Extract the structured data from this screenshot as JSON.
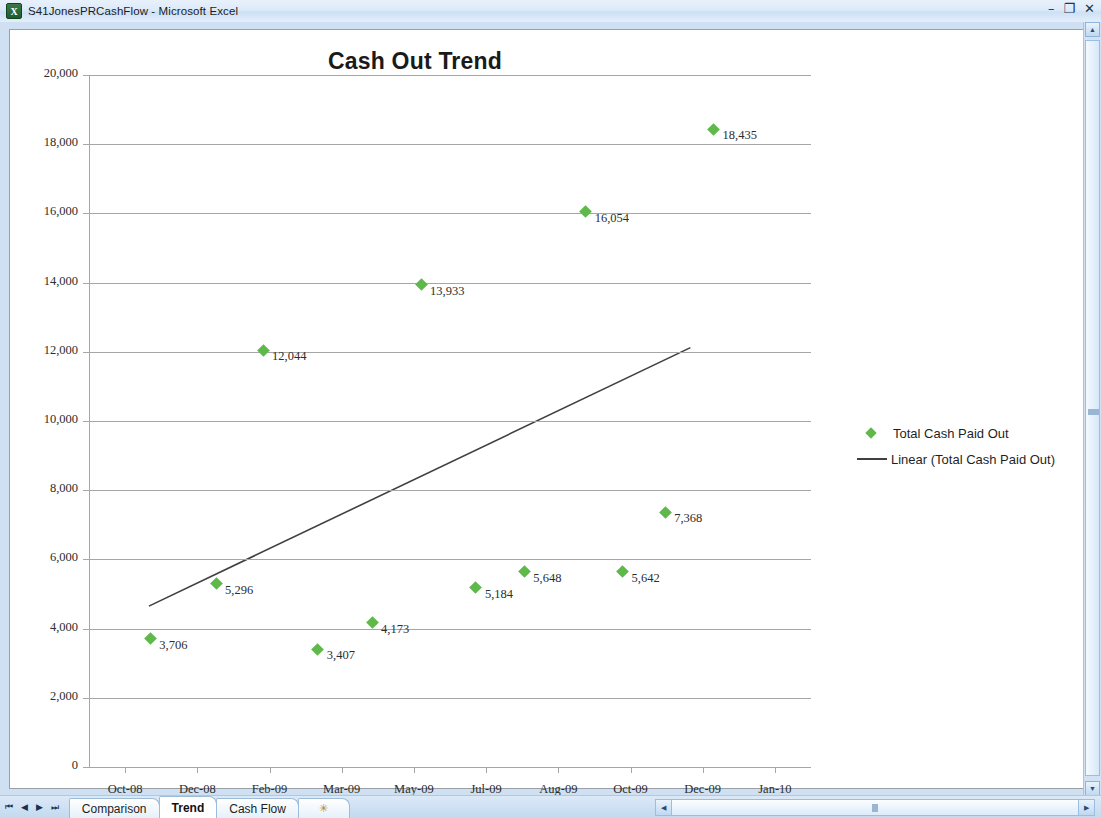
{
  "window": {
    "title": "S41JonesPRCashFlow - Microsoft Excel",
    "app_icon": "excel-icon",
    "controls": {
      "minimize": "–",
      "restore": "❐",
      "close": "✕"
    }
  },
  "sheet_tabs": {
    "nav": {
      "first": "⏮",
      "prev": "◀",
      "next": "▶",
      "last": "⏭"
    },
    "items": [
      {
        "label": "Comparison",
        "active": false
      },
      {
        "label": "Trend",
        "active": true
      },
      {
        "label": "Cash Flow",
        "active": false
      }
    ],
    "insert_tab": "✳"
  },
  "chart_data": {
    "type": "scatter",
    "title": "Cash Out Trend",
    "xlabel": "",
    "ylabel": "",
    "ylim": [
      0,
      20000
    ],
    "grid": true,
    "legend_position": "right",
    "y_ticks": [
      "0",
      "2,000",
      "4,000",
      "6,000",
      "8,000",
      "10,000",
      "12,000",
      "14,000",
      "16,000",
      "18,000",
      "20,000"
    ],
    "y_tick_values": [
      0,
      2000,
      4000,
      6000,
      8000,
      10000,
      12000,
      14000,
      16000,
      18000,
      20000
    ],
    "x_ticks": [
      "Oct-08",
      "Dec-08",
      "Feb-09",
      "Mar-09",
      "May-09",
      "Jul-09",
      "Aug-09",
      "Oct-09",
      "Dec-09",
      "Jan-10"
    ],
    "series": [
      {
        "name": "Total Cash Paid Out",
        "color": "#5fb94a",
        "marker": "diamond",
        "points": [
          {
            "x": 0.35,
            "value": 3706,
            "label": "3,706",
            "label_side": "right"
          },
          {
            "x": 1.26,
            "value": 5296,
            "label": "5,296",
            "label_side": "right"
          },
          {
            "x": 1.91,
            "value": 12044,
            "label": "12,044",
            "label_side": "right"
          },
          {
            "x": 2.67,
            "value": 3407,
            "label": "3,407",
            "label_side": "right"
          },
          {
            "x": 3.42,
            "value": 4173,
            "label": "4,173",
            "label_side": "right"
          },
          {
            "x": 4.1,
            "value": 13933,
            "label": "13,933",
            "label_side": "right"
          },
          {
            "x": 4.86,
            "value": 5184,
            "label": "5,184",
            "label_side": "right"
          },
          {
            "x": 5.53,
            "value": 5648,
            "label": "5,648",
            "label_side": "right"
          },
          {
            "x": 6.38,
            "value": 16054,
            "label": "16,054",
            "label_side": "right"
          },
          {
            "x": 6.89,
            "value": 5642,
            "label": "5,642",
            "label_side": "right"
          },
          {
            "x": 7.48,
            "value": 7368,
            "label": "7,368",
            "label_side": "right"
          },
          {
            "x": 8.15,
            "value": 18435,
            "label": "18,435",
            "label_side": "right"
          }
        ]
      }
    ],
    "trendline": {
      "name": "Linear (Total Cash Paid Out)",
      "color": "#404040",
      "x_start": 0.33,
      "y_start": 4650,
      "x_end": 7.83,
      "y_end": 12120
    },
    "legend": [
      {
        "label": "Total Cash Paid Out",
        "type": "marker",
        "color": "#5fb94a"
      },
      {
        "label": "Linear (Total Cash Paid Out)",
        "type": "line",
        "color": "#404040"
      }
    ]
  }
}
